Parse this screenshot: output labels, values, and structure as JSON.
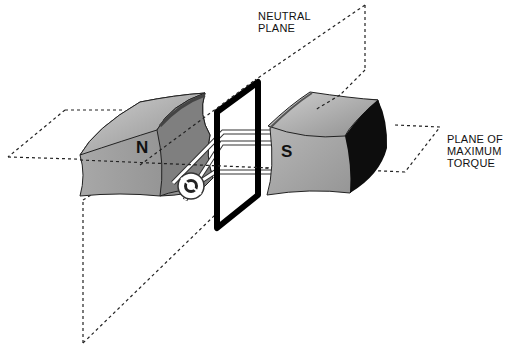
{
  "diagram": {
    "labels": {
      "neutral_plane": [
        "NEUTRAL",
        "PLANE"
      ],
      "max_torque_plane": [
        "PLANE OF",
        "MAXIMUM",
        "TORQUE"
      ],
      "north_pole": "N",
      "south_pole": "S"
    },
    "colors": {
      "magnet_face": "#9a9a9a",
      "magnet_top": "#b5b5b5",
      "magnet_dark": "#111111",
      "coil": "#000000",
      "dash": "#222222"
    }
  }
}
